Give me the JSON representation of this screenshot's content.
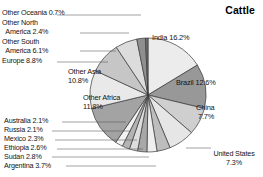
{
  "chart_data": {
    "type": "pie",
    "title": "Cattle",
    "xlabel": "",
    "ylabel": "",
    "legend_position": "none",
    "grid": false,
    "categories": [
      "India",
      "Brazil",
      "China",
      "United States",
      "Argentina",
      "Sudan",
      "Ethiopia",
      "Mexico",
      "Russia",
      "Australia",
      "Other Africa",
      "Other Asia",
      "Europe",
      "Other South America",
      "Other North America",
      "Other Oceania"
    ],
    "values": [
      16.2,
      12.6,
      7.7,
      7.3,
      3.7,
      2.8,
      2.6,
      2.3,
      2.1,
      2.1,
      11.8,
      10.8,
      8.8,
      6.1,
      2.4,
      0.7
    ],
    "unit": "%",
    "labels": [
      "India 16.2%",
      "Brazil 12.6%",
      "China 7.7%",
      "United States 7.3%",
      "Argentina 3.7%",
      "Sudan 2.8%",
      "Ethiopia 2.6%",
      "Mexico 2.3%",
      "Russia 2.1%",
      "Australia 2.1%",
      "Other Africa 11.8%",
      "Other Asia 10.8%",
      "Europe 8.8%",
      "Other South America 6.1%",
      "Other North America 2.4%",
      "Other Oceania 0.7%"
    ],
    "slice_colors": [
      "#ececec",
      "#989898",
      "#cfcfcf",
      "#e6e6e6",
      "#bdbdbd",
      "#efefef",
      "#a8a8a8",
      "#dedede",
      "#b4b4b4",
      "#f2f2f2",
      "#a3a3a3",
      "#e9e9e9",
      "#c6c6c6",
      "#dcdcdc",
      "#8f8f8f",
      "#6f6f6f"
    ]
  },
  "title": {
    "text": "Cattle"
  },
  "labels": {
    "other_oceania": "Other Oceania 0.7%",
    "other_north_1": "Other North",
    "other_north_2": "  America 2.4%",
    "other_south_1": "Other South",
    "other_south_2": "  America 6.1%",
    "europe": "Europe 8.8%",
    "australia": "Australia 2.1%",
    "russia": "Russia 2.1%",
    "mexico": "Mexico 2.3%",
    "ethiopia": "Ethiopia 2.6%",
    "sudan": "Sudan 2.8%",
    "argentina": "Argentina 3.7%",
    "other_asia_1": "Other Asia",
    "other_asia_2": "10.8%",
    "other_africa_1": "Other Africa",
    "other_africa_2": "11.8%",
    "india": "India 16.2%",
    "brazil": "Brazil 12.6%",
    "china_1": "China",
    "china_2": "7.7%",
    "united_states_1": "United States",
    "united_states_2": "7.3%"
  }
}
